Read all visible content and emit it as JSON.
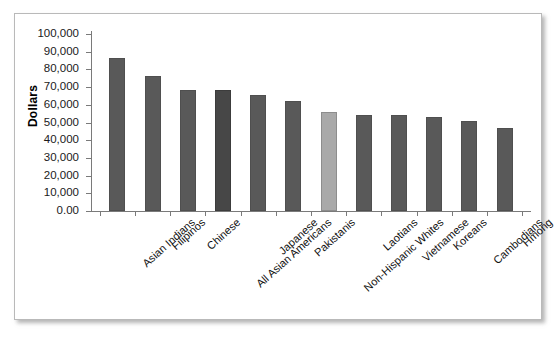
{
  "chart_data": {
    "type": "bar",
    "title": "",
    "xlabel": "",
    "ylabel": "Dollars",
    "ylim": [
      0,
      100000
    ],
    "grid": false,
    "legend": "none",
    "categories": [
      "Asian Indians",
      "Filipinos",
      "Chinese",
      "All Asian Americans",
      "Japanese",
      "Pakistanis",
      "Non-Hispanic Whites",
      "Laotians",
      "Vietnamese",
      "Koreans",
      "Cambodians",
      "Hmong"
    ],
    "values": [
      86500,
      76500,
      68500,
      68300,
      65500,
      62000,
      56000,
      54500,
      54500,
      53000,
      51000,
      47000
    ],
    "ytick_labels": [
      "100,000",
      "90,000",
      "80,000",
      "70,000",
      "60,000",
      "50,000",
      "40,000",
      "30,000",
      "20,000",
      "10,000",
      "0.00"
    ],
    "ytick_values": [
      100000,
      90000,
      80000,
      70000,
      60000,
      50000,
      40000,
      30000,
      20000,
      10000,
      0
    ],
    "bar_styles": [
      "default",
      "default",
      "default",
      "emphasis",
      "default",
      "default",
      "light",
      "default",
      "default",
      "default",
      "default",
      "default"
    ],
    "colors": {
      "bar_default": "#595959",
      "bar_emphasis": "#474747",
      "bar_light": "#a9a9a9",
      "axis": "#7a7a7a",
      "text": "#111111",
      "frame": "#b9b9b9",
      "background": "#ffffff"
    }
  }
}
